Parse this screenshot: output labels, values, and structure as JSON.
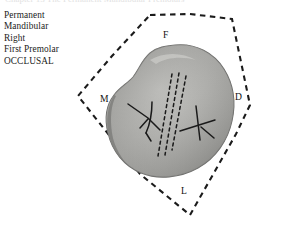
{
  "figure": {
    "running_head": "Chapter 13  The Permanent Mandibular Premolars",
    "caption_lines": [
      "Permanent",
      "Mandibular",
      "Right",
      "First Premolar",
      "OCCLUSAL"
    ],
    "orientation": {
      "facial": "F",
      "mesial": "M",
      "distal": "D",
      "lingual": "L"
    },
    "colors": {
      "tooth_fill": "#a9a9a7",
      "tooth_shadow": "#6f6f6d",
      "tooth_highlight": "#c4c4c1",
      "groove_stroke": "#1a1a1a",
      "frame_stroke": "#1b1b1b",
      "background": "#ffffff",
      "text": "#1b1b1b"
    },
    "frame": {
      "shape": "dashed-diamond",
      "vertices_px": [
        [
          190,
          14
        ],
        [
          250,
          105
        ],
        [
          190,
          215
        ],
        [
          78,
          96
        ]
      ]
    },
    "tooth": {
      "view": "occlusal",
      "outline_description": "rounded irregular occlusal outline of mandibular right first premolar",
      "markings": [
        "mesiolingual groove cluster",
        "central developmental groove (dashed parallel strands)",
        "distal triangular fossa groove (x-shaped)"
      ]
    }
  }
}
